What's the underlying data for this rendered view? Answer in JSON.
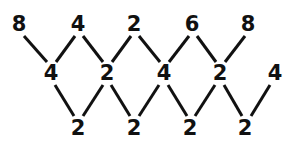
{
  "diagram": {
    "type": "zigzag-number-lattice",
    "background_color": "#ffffff",
    "text_color": "#111111",
    "line_color": "#111111",
    "line_width": 3,
    "rows": [
      {
        "name": "top-row",
        "y": 24,
        "nodes": [
          {
            "id": "t0",
            "value": "8",
            "x": 19
          },
          {
            "id": "t1",
            "value": "4",
            "x": 78
          },
          {
            "id": "t2",
            "value": "2",
            "x": 134
          },
          {
            "id": "t3",
            "value": "6",
            "x": 192
          },
          {
            "id": "t4",
            "value": "8",
            "x": 248
          }
        ]
      },
      {
        "name": "middle-row",
        "y": 73,
        "nodes": [
          {
            "id": "m0",
            "value": "4",
            "x": 51
          },
          {
            "id": "m1",
            "value": "2",
            "x": 107
          },
          {
            "id": "m2",
            "value": "4",
            "x": 164
          },
          {
            "id": "m3",
            "value": "2",
            "x": 220
          },
          {
            "id": "m4",
            "value": "4",
            "x": 275
          }
        ]
      },
      {
        "name": "bottom-row",
        "y": 128,
        "nodes": [
          {
            "id": "b0",
            "value": "2",
            "x": 78
          },
          {
            "id": "b1",
            "value": "2",
            "x": 134
          },
          {
            "id": "b2",
            "value": "2",
            "x": 190
          },
          {
            "id": "b3",
            "value": "2",
            "x": 245
          }
        ]
      }
    ],
    "edges": [
      {
        "id": "e-t0-m0",
        "from": "t0",
        "to": "m0",
        "x1": 24,
        "y1": 36,
        "x2": 47,
        "y2": 62
      },
      {
        "id": "e-m0-t1",
        "from": "m0",
        "to": "t1",
        "x1": 56,
        "y1": 62,
        "x2": 75,
        "y2": 36
      },
      {
        "id": "e-t1-m1",
        "from": "t1",
        "to": "m1",
        "x1": 83,
        "y1": 36,
        "x2": 103,
        "y2": 62
      },
      {
        "id": "e-m1-t2",
        "from": "m1",
        "to": "t2",
        "x1": 112,
        "y1": 62,
        "x2": 131,
        "y2": 36
      },
      {
        "id": "e-t2-m2",
        "from": "t2",
        "to": "m2",
        "x1": 139,
        "y1": 36,
        "x2": 160,
        "y2": 62
      },
      {
        "id": "e-m2-t3",
        "from": "m2",
        "to": "t3",
        "x1": 169,
        "y1": 62,
        "x2": 189,
        "y2": 36
      },
      {
        "id": "e-t3-m3",
        "from": "t3",
        "to": "m3",
        "x1": 197,
        "y1": 36,
        "x2": 216,
        "y2": 62
      },
      {
        "id": "e-m3-t4",
        "from": "m3",
        "to": "t4",
        "x1": 225,
        "y1": 62,
        "x2": 245,
        "y2": 36
      },
      {
        "id": "e-m0-b0",
        "from": "m0",
        "to": "b0",
        "x1": 55,
        "y1": 85,
        "x2": 74,
        "y2": 116
      },
      {
        "id": "e-b0-m1",
        "from": "b0",
        "to": "m1",
        "x1": 83,
        "y1": 116,
        "x2": 103,
        "y2": 85
      },
      {
        "id": "e-m1-b1",
        "from": "m1",
        "to": "b1",
        "x1": 111,
        "y1": 85,
        "x2": 130,
        "y2": 116
      },
      {
        "id": "e-b1-m2",
        "from": "b1",
        "to": "m2",
        "x1": 139,
        "y1": 116,
        "x2": 159,
        "y2": 85
      },
      {
        "id": "e-m2-b2",
        "from": "m2",
        "to": "b2",
        "x1": 168,
        "y1": 85,
        "x2": 187,
        "y2": 116
      },
      {
        "id": "e-b2-m3",
        "from": "b2",
        "to": "m3",
        "x1": 195,
        "y1": 116,
        "x2": 215,
        "y2": 85
      },
      {
        "id": "e-m3-b3",
        "from": "m3",
        "to": "b3",
        "x1": 224,
        "y1": 85,
        "x2": 242,
        "y2": 116
      },
      {
        "id": "e-b3-m4",
        "from": "b3",
        "to": "m4",
        "x1": 251,
        "y1": 116,
        "x2": 270,
        "y2": 85
      }
    ]
  }
}
